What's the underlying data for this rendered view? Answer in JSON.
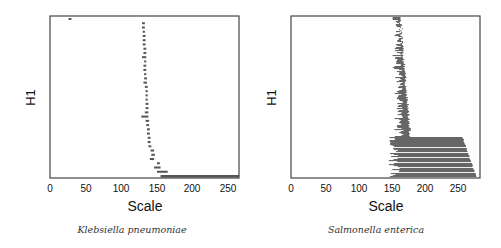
{
  "chart_data": [
    {
      "type": "bar",
      "orientation": "horizontal",
      "title": "Klebsiella pneumoniae",
      "xlabel": "Scale",
      "ylabel": "H1",
      "xlim": [
        0,
        265
      ],
      "xticks": [
        0,
        50,
        100,
        150,
        200,
        250
      ],
      "grid": false,
      "legend": null,
      "bar_color": "#555555",
      "note": "Floating horizontal segments (interval bars) per H1 entry, from top to bottom; values are [start, end] on the Scale axis.",
      "intervals": [
        [
          26,
          30
        ],
        [
          129,
          133
        ],
        [
          129,
          133
        ],
        [
          130,
          133
        ],
        [
          130,
          134
        ],
        [
          130,
          134
        ],
        [
          130,
          134
        ],
        [
          131,
          135
        ],
        [
          131,
          135
        ],
        [
          129,
          135
        ],
        [
          132,
          135
        ],
        [
          131,
          135
        ],
        [
          131,
          135
        ],
        [
          132,
          135
        ],
        [
          132,
          136
        ],
        [
          131,
          136
        ],
        [
          133,
          137
        ],
        [
          134,
          137
        ],
        [
          134,
          137
        ],
        [
          134,
          137
        ],
        [
          134,
          138
        ],
        [
          134,
          138
        ],
        [
          133,
          138
        ],
        [
          128,
          138
        ],
        [
          134,
          139
        ],
        [
          135,
          139
        ],
        [
          136,
          140
        ],
        [
          136,
          140
        ],
        [
          137,
          141
        ],
        [
          137,
          141
        ],
        [
          138,
          142
        ],
        [
          141,
          146
        ],
        [
          142,
          147
        ],
        [
          140,
          146
        ],
        [
          150,
          154
        ],
        [
          146,
          155
        ],
        [
          150,
          165
        ],
        [
          155,
          265
        ]
      ]
    },
    {
      "type": "bar",
      "orientation": "horizontal",
      "title": "Salmonella enterica",
      "xlabel": "Scale",
      "ylabel": "H1",
      "xlim": [
        0,
        290
      ],
      "xticks": [
        0,
        50,
        100,
        150,
        200,
        250
      ],
      "grid": false,
      "legend": null,
      "bar_color": "#666666",
      "note": "Dense horizontal interval bars; upper ~75% of rows span roughly 155-190, lower rows span roughly 150-285.",
      "upper_block": {
        "start_range": [
          155,
          175
        ],
        "end_range": [
          170,
          190
        ],
        "rows": "approx 80% of entries"
      },
      "lower_block": {
        "start_range": [
          148,
          170
        ],
        "end_range": [
          262,
          287
        ],
        "rows": "approx 20% of entries"
      }
    }
  ],
  "panels": [
    {
      "ylabel": "H1",
      "xlabel": "Scale",
      "caption": "Klebsiella pneumoniae",
      "ticks": [
        "0",
        "50",
        "100",
        "150",
        "200",
        "250"
      ]
    },
    {
      "ylabel": "H1",
      "xlabel": "Scale",
      "caption": "Salmonella enterica",
      "ticks": [
        "0",
        "50",
        "100",
        "150",
        "200",
        "250"
      ]
    }
  ]
}
